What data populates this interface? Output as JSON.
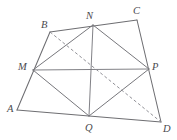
{
  "figure": {
    "background_color": "#ffffff",
    "stroke_color": "#6e6e72",
    "dash_color": "#8a8a90",
    "label_color": "#4a4a4e",
    "width": 177,
    "height": 140
  },
  "points": {
    "A": {
      "label": "A",
      "x": 17,
      "y": 110,
      "label_x": 7,
      "label_y": 104
    },
    "B": {
      "label": "B",
      "x": 50,
      "y": 32,
      "label_x": 41,
      "label_y": 20
    },
    "C": {
      "label": "C",
      "x": 137,
      "y": 20,
      "label_x": 133,
      "label_y": 6
    },
    "D": {
      "label": "D",
      "x": 161,
      "y": 122,
      "label_x": 163,
      "label_y": 124
    },
    "M": {
      "label": "M",
      "x": 33,
      "y": 70,
      "label_x": 18,
      "label_y": 62
    },
    "N": {
      "label": "N",
      "x": 93,
      "y": 25,
      "label_x": 86,
      "label_y": 11
    },
    "P": {
      "label": "P",
      "x": 149,
      "y": 69,
      "label_x": 152,
      "label_y": 62
    },
    "Q": {
      "label": "Q",
      "x": 89,
      "y": 116,
      "label_x": 85,
      "label_y": 123
    }
  },
  "edges": {
    "outer": [
      {
        "name": "edge-AB",
        "from": "A",
        "to": "B",
        "style": "solid"
      },
      {
        "name": "edge-BC",
        "from": "B",
        "to": "C",
        "style": "solid"
      },
      {
        "name": "edge-CD",
        "from": "C",
        "to": "D",
        "style": "solid"
      },
      {
        "name": "edge-DA",
        "from": "D",
        "to": "A",
        "style": "solid"
      }
    ],
    "inner": [
      {
        "name": "edge-MN",
        "from": "M",
        "to": "N",
        "style": "solid"
      },
      {
        "name": "edge-NP",
        "from": "N",
        "to": "P",
        "style": "solid"
      },
      {
        "name": "edge-PQ",
        "from": "P",
        "to": "Q",
        "style": "solid"
      },
      {
        "name": "edge-QM",
        "from": "Q",
        "to": "M",
        "style": "solid"
      }
    ],
    "diagonals": [
      {
        "name": "diagonal-MP",
        "from": "M",
        "to": "P",
        "style": "solid"
      },
      {
        "name": "diagonal-NQ",
        "from": "N",
        "to": "Q",
        "style": "solid"
      },
      {
        "name": "diagonal-BD",
        "from": "B",
        "to": "D",
        "style": "dashed"
      }
    ]
  }
}
